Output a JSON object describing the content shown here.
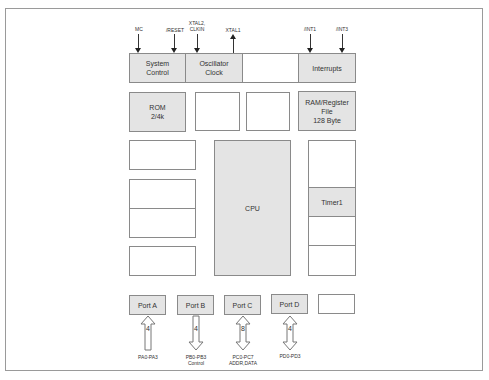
{
  "diagram": {
    "type": "microcontroller-block-diagram",
    "signals_top": [
      {
        "id": "mc",
        "label": "MC",
        "direction": "in",
        "target": "system_control"
      },
      {
        "id": "reset",
        "label": "/RESET",
        "direction": "in",
        "target": "system_control"
      },
      {
        "id": "xtal2",
        "label_line1": "XTAL2,",
        "label_line2": "CLKIN",
        "direction": "in",
        "target": "oscillator_clock"
      },
      {
        "id": "xtal1",
        "label": "XTAL1",
        "direction": "out",
        "target": "oscillator_clock"
      },
      {
        "id": "int1",
        "label": "/INT1",
        "direction": "in",
        "target": "interrupts"
      },
      {
        "id": "int3",
        "label": "/INT3",
        "direction": "in",
        "target": "interrupts"
      }
    ],
    "blocks": {
      "system_control": {
        "line1": "System",
        "line2": "Control",
        "shaded": true
      },
      "oscillator_clock": {
        "line1": "Oscillator",
        "line2": "Clock",
        "shaded": true
      },
      "top_empty": {
        "label": "",
        "shaded": false
      },
      "interrupts": {
        "label": "Interrupts",
        "shaded": true
      },
      "rom": {
        "line1": "ROM",
        "line2": "2/4k",
        "shaded": true
      },
      "mid_empty_1": {
        "label": "",
        "shaded": false
      },
      "mid_empty_2": {
        "label": "",
        "shaded": false
      },
      "ram": {
        "line1": "RAM/Register",
        "line2": "File",
        "line3": "128 Byte",
        "shaded": true
      },
      "cpu": {
        "label": "CPU",
        "shaded": true
      },
      "timer1": {
        "label": "Timer1",
        "shaded": true
      },
      "left_empty_1": {
        "label": ""
      },
      "left_empty_2a": {
        "label": ""
      },
      "left_empty_2b": {
        "label": ""
      },
      "left_empty_3": {
        "label": ""
      },
      "right_empty_top": {
        "label": ""
      },
      "right_empty_mid": {
        "label": ""
      },
      "right_empty_bot": {
        "label": ""
      }
    },
    "ports": [
      {
        "id": "port_a",
        "label": "Port A",
        "bus_width": "4",
        "direction": "in",
        "pins_line1": "PA0-PA3",
        "pins_line2": ""
      },
      {
        "id": "port_b",
        "label": "Port B",
        "bus_width": "4",
        "direction": "out",
        "pins_line1": "PB0-PB3",
        "pins_line2": "Control"
      },
      {
        "id": "port_c",
        "label": "Port C",
        "bus_width": "8",
        "direction": "bidirectional",
        "pins_line1": "PC0-PC7",
        "pins_line2": "ADDR,DATA"
      },
      {
        "id": "port_d",
        "label": "Port D",
        "bus_width": "4",
        "direction": "bidirectional",
        "pins_line1": "PD0-PD3",
        "pins_line2": ""
      },
      {
        "id": "port_empty",
        "label": ""
      }
    ],
    "colors": {
      "border": "#8a8a8a",
      "shade": "#e4e4e4",
      "arrow": "#222222"
    }
  }
}
